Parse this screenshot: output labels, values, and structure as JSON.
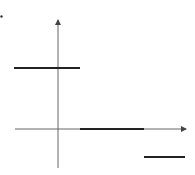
{
  "chart_data": {
    "type": "line",
    "title": "",
    "xlabel": "",
    "ylabel": "",
    "grid": false,
    "legend": null,
    "axes": {
      "origin_px": [
        58,
        129
      ],
      "x_axis": {
        "from_px": 15,
        "to_px": 186,
        "arrow": true
      },
      "y_axis": {
        "from_px": 168,
        "to_px": 20,
        "arrow": true
      }
    },
    "segments": [
      {
        "x0": -1,
        "x1": 0.5,
        "y": 1,
        "px": {
          "x0": 14,
          "x1": 80,
          "y": 68
        }
      },
      {
        "x0": 0.5,
        "x1": 1.5,
        "y": 0,
        "px": {
          "x0": 80,
          "x1": 144,
          "y": 129
        }
      },
      {
        "x0": 1.5,
        "x1": 2.1,
        "y": -0.5,
        "px": {
          "x0": 144,
          "x1": 185,
          "y": 157
        }
      }
    ],
    "marker_dot_px": [
      1,
      16
    ],
    "colors": {
      "axis": "#555555",
      "segment": "#222222",
      "background": "#ffffff"
    }
  }
}
